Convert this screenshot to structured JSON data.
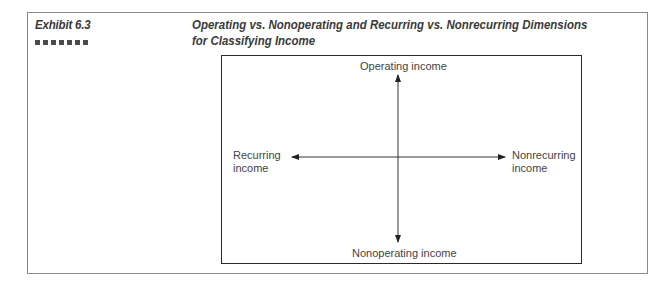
{
  "exhibit": {
    "label": "Exhibit 6.3",
    "title_line1": "Operating vs. Nonoperating and Recurring vs. Nonrecurring Dimensions",
    "title_line2": "for Classifying Income"
  },
  "diagram": {
    "top_label": "Operating income",
    "bottom_label": "Nonoperating income",
    "left_label_line1": "Recurring",
    "left_label_line2": "income",
    "right_label_line1": "Nonrecurring",
    "right_label_line2": "income"
  }
}
